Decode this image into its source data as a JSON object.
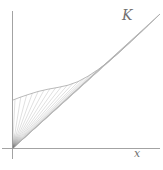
{
  "figure": {
    "labels": {
      "curve": "K",
      "x_axis": "x"
    },
    "colors": {
      "background": "#ffffff",
      "axis": "#999999",
      "ray": "#c6c6c6",
      "curve": "#a8a8a8",
      "label": "#707070",
      "origin_shade": "#4a4a4a"
    }
  },
  "chart_data": {
    "type": "line",
    "title": "",
    "axes": {
      "x_label": "x",
      "y_label": "",
      "ticks": "none",
      "x_axis_px": {
        "y": 148.5,
        "x1": 2,
        "x2": 160
      },
      "y_axis_px": {
        "x": 12.5,
        "y1": 11,
        "y2": 159
      }
    },
    "origin_px": [
      12.5,
      148.5
    ],
    "series": [
      {
        "name": "K",
        "points_px": [
          [
            13,
            100
          ],
          [
            20,
            97.3
          ],
          [
            28,
            94.6
          ],
          [
            38,
            91.5
          ],
          [
            48,
            89.2
          ],
          [
            58,
            87.4
          ],
          [
            68,
            85.2
          ],
          [
            78,
            81.6
          ],
          [
            88,
            76.2
          ],
          [
            98,
            69.6
          ],
          [
            108,
            62
          ],
          [
            118,
            53.5
          ],
          [
            130,
            42.5
          ],
          [
            145,
            28.5
          ],
          [
            160,
            14
          ]
        ]
      }
    ],
    "rays": {
      "count": 26,
      "endpoint_x_start": 15,
      "endpoint_x_end": 160
    }
  }
}
